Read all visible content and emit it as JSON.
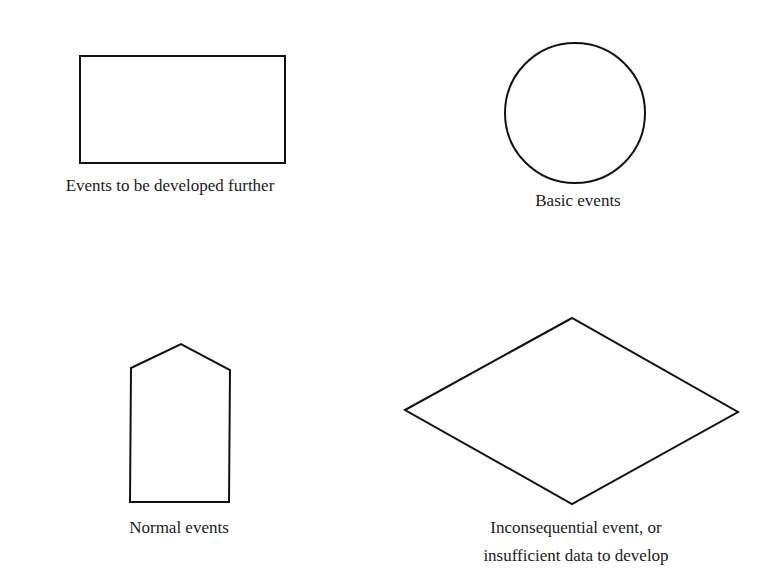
{
  "colors": {
    "stroke": "#111111",
    "text": "#1a1a1a",
    "background": "#ffffff"
  },
  "symbols": [
    {
      "id": "rectangle",
      "shape": "rectangle",
      "label_lines": [
        "Events to be developed further"
      ]
    },
    {
      "id": "circle",
      "shape": "circle",
      "label_lines": [
        "Basic events"
      ]
    },
    {
      "id": "house",
      "shape": "house-pentagon",
      "label_lines": [
        "Normal events"
      ]
    },
    {
      "id": "diamond",
      "shape": "diamond",
      "label_lines": [
        "Inconsequential event, or",
        "insufficient data to develop"
      ]
    }
  ]
}
